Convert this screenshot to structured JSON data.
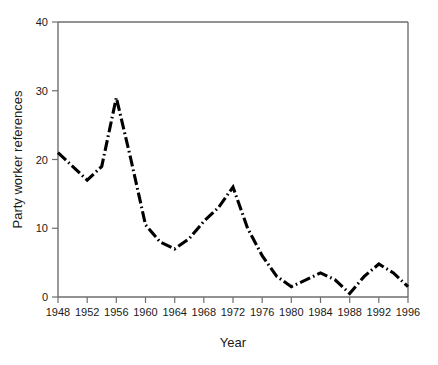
{
  "chart_data": {
    "type": "line",
    "title": "",
    "xlabel": "Year",
    "ylabel": "Party worker references",
    "xlim": [
      1948,
      1996
    ],
    "ylim": [
      0,
      40
    ],
    "grid": false,
    "legend": null,
    "xticks": [
      1948,
      1952,
      1956,
      1960,
      1964,
      1968,
      1972,
      1976,
      1980,
      1984,
      1988,
      1992,
      1996
    ],
    "yticks": [
      0,
      10,
      20,
      30,
      40
    ],
    "line_style": "dash-dot",
    "line_color": "#000000",
    "x": [
      1948,
      1950,
      1952,
      1954,
      1956,
      1958,
      1960,
      1962,
      1964,
      1966,
      1968,
      1970,
      1972,
      1974,
      1976,
      1978,
      1980,
      1982,
      1984,
      1986,
      1988,
      1990,
      1992,
      1994,
      1996
    ],
    "values": [
      21,
      19,
      17,
      19,
      29,
      20,
      10.5,
      8,
      7,
      8.5,
      11,
      13,
      16,
      10,
      6,
      3,
      1.5,
      2.5,
      3.5,
      2.5,
      0.5,
      3,
      4.8,
      3.5,
      1.5
    ],
    "series": [
      {
        "name": "Party worker references",
        "values": [
          21,
          19,
          17,
          19,
          29,
          20,
          10.5,
          8,
          7,
          8.5,
          11,
          13,
          16,
          10,
          6,
          3,
          1.5,
          2.5,
          3.5,
          2.5,
          0.5,
          3,
          4.8,
          3.5,
          1.5
        ]
      }
    ]
  },
  "axis": {
    "x_title": "Year",
    "y_title": "Party worker references",
    "x_tick_labels": [
      "1948",
      "1952",
      "1956",
      "1960",
      "1964",
      "1968",
      "1972",
      "1976",
      "1980",
      "1984",
      "1988",
      "1992",
      "1996"
    ],
    "y_tick_labels": [
      "0",
      "10",
      "20",
      "30",
      "40"
    ]
  },
  "colors": {
    "line": "#000000",
    "axis": "#6e6e6e",
    "text": "#1a1a1a",
    "background": "#ffffff"
  }
}
